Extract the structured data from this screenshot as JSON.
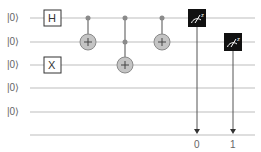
{
  "circuit": {
    "qubits": [
      {
        "label": "|0⟩"
      },
      {
        "label": "|0⟩"
      },
      {
        "label": "|0⟩"
      },
      {
        "label": "|0⟩"
      },
      {
        "label": "|0⟩"
      }
    ],
    "gates": [
      {
        "type": "H",
        "label": "H",
        "qubit": 0
      },
      {
        "type": "X",
        "label": "X",
        "qubit": 2
      },
      {
        "type": "CNOT",
        "controls": [
          0
        ],
        "target": 1
      },
      {
        "type": "CCNOT",
        "controls": [
          0,
          1
        ],
        "target": 2
      },
      {
        "type": "CNOT",
        "controls": [
          0
        ],
        "target": 1
      },
      {
        "type": "Measure",
        "qubit": 0,
        "classical_bit": 0,
        "icon": "meter-z-icon",
        "axis": "z"
      },
      {
        "type": "Measure",
        "qubit": 1,
        "classical_bit": 1,
        "icon": "meter-z-icon",
        "axis": "z"
      }
    ],
    "classical_labels": [
      "0",
      "1"
    ],
    "colors": {
      "wire": "#bdbdbd",
      "target_fill": "#c4c4c4",
      "target_stroke": "#8a8a8a",
      "control": "#8a8a8a",
      "measure_bg": "#111111",
      "text": "#666666"
    }
  }
}
